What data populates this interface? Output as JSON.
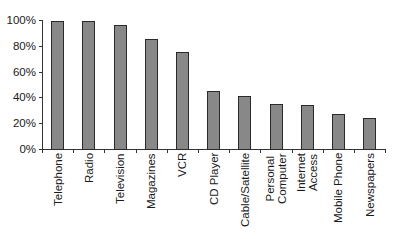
{
  "chart_data": {
    "type": "bar",
    "title": "",
    "xlabel": "",
    "ylabel": "",
    "ylim": [
      0,
      100
    ],
    "y_tick_labels": [
      "0%",
      "20%",
      "40%",
      "60%",
      "80%",
      "100%"
    ],
    "grid": false,
    "legend": null,
    "categories": [
      "Telephone",
      "Radio",
      "Television",
      "Magazines",
      "VCR",
      "CD Player",
      "Cable/Satellite",
      "Personal Computer",
      "Internet Access",
      "Mobile Phone",
      "Newspapers"
    ],
    "category_label_lines": [
      [
        "Telephone"
      ],
      [
        "Radio"
      ],
      [
        "Television"
      ],
      [
        "Magazines"
      ],
      [
        "VCR"
      ],
      [
        "CD Player"
      ],
      [
        "Cable/Satellite"
      ],
      [
        "Personal",
        "Computer"
      ],
      [
        "Internet",
        "Access"
      ],
      [
        "Mobile Phone"
      ],
      [
        "Newspapers"
      ]
    ],
    "values": [
      99,
      99,
      96,
      85,
      75,
      45,
      41,
      35,
      34,
      27,
      24
    ],
    "bar_color": "#888888",
    "bar_border_color": "#2a2a2a"
  }
}
